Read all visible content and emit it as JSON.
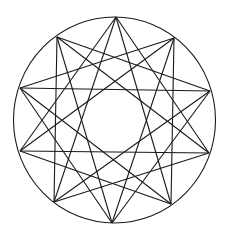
{
  "figure": {
    "type": "star-polygon-diagram",
    "stroke_color": "#1a1a1a",
    "background": "#ffffff",
    "circle": {
      "cx": 114.5,
      "cy": 120,
      "rx": 101,
      "ry": 103
    },
    "vertices": [
      [
        116,
        17
      ],
      [
        174,
        38
      ],
      [
        210,
        91
      ],
      [
        209,
        153
      ],
      [
        171,
        204
      ],
      [
        112,
        223
      ],
      [
        54,
        202
      ],
      [
        20,
        151
      ],
      [
        20,
        88
      ],
      [
        57,
        37
      ]
    ],
    "chord_steps": [
      3,
      4
    ]
  }
}
